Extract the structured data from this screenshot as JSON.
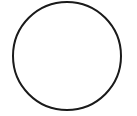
{
  "canvas": {
    "width": 137,
    "height": 116,
    "background": "#ffffff"
  },
  "shapes": [
    {
      "type": "circle",
      "cx": 67,
      "cy": 56,
      "r": 54,
      "stroke": "#1a1a1a",
      "stroke_width": 2,
      "fill": "none"
    }
  ]
}
